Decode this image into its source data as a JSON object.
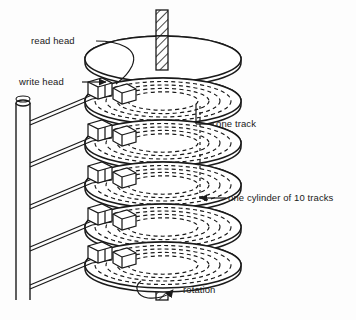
{
  "figure": {
    "background_color": "#fdfdfd",
    "ink_color": "#1a1a1a"
  },
  "labels": {
    "read_head": "read head",
    "write_head": "write head",
    "one_track": "one track",
    "one_cylinder": "one cylinder of 10 tracks",
    "rotation": "rotation"
  },
  "structure": {
    "platter_count": 5,
    "tracks_per_cylinder": 10,
    "head_assembly_count": 5,
    "arm_pair_count": 5,
    "spindle": "hatched-shaft",
    "rotation_direction": "counter-clockwise"
  },
  "icons": {
    "rotation_arrow": "curved-arrow-icon",
    "write_head_pointer": "arrow-right-icon",
    "read_head_leader": "curved-leader-icon",
    "track_leader": "leader-line-icon",
    "cylinder_leader": "arrow-left-icon"
  }
}
